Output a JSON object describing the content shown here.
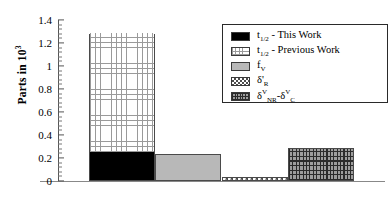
{
  "chart_data": {
    "type": "bar",
    "title": "",
    "xlabel": "",
    "ylabel": "Parts in 10",
    "ylabel_exponent": "3",
    "ylim": [
      0,
      1.4
    ],
    "ytick_step": 0.2,
    "yticks": [
      "1.4",
      "1.2",
      "1",
      "0.8",
      "0.6",
      "0.4",
      "0.2",
      "0"
    ],
    "ytick_values": [
      1.4,
      1.2,
      1.0,
      0.8,
      0.6,
      0.4,
      0.2,
      0.0
    ],
    "grid": false,
    "legend_position": "upper-right",
    "categories": [
      "bar-1",
      "bar-2",
      "bar-3",
      "bar-4"
    ],
    "series": [
      {
        "name": "t-half-this-work",
        "pattern": "solid-black",
        "values": [
          0.245,
          0,
          0,
          0
        ]
      },
      {
        "name": "t-half-previous-work",
        "pattern": "grid",
        "values": [
          1.03,
          0,
          0,
          0
        ],
        "stacked_on": "t-half-this-work",
        "stack_top": 1.275
      },
      {
        "name": "f-v",
        "pattern": "gray",
        "values": [
          0,
          0.232,
          0,
          0
        ]
      },
      {
        "name": "delta-prime-R",
        "pattern": "checker",
        "values": [
          0,
          0,
          0.035,
          0
        ]
      },
      {
        "name": "delta-V-NR-minus-delta-V-C",
        "pattern": "brick",
        "values": [
          0,
          0,
          0,
          0.29
        ]
      }
    ]
  },
  "legend": {
    "items": [
      {
        "name": "legend-t-half-this-work",
        "pattern": "solid-black",
        "prefix": "t",
        "sub": "1/2",
        "suffix": " - This Work"
      },
      {
        "name": "legend-t-half-previous-work",
        "pattern": "grid",
        "prefix": "t",
        "sub": "1/2",
        "suffix": " - Previous Work"
      },
      {
        "name": "legend-f-v",
        "pattern": "gray",
        "prefix": "f",
        "sub": "V",
        "suffix": ""
      },
      {
        "name": "legend-delta-prime-R",
        "pattern": "checker",
        "prefix": "δ'",
        "sub": "R",
        "suffix": ""
      },
      {
        "name": "legend-delta-V-nr-c",
        "pattern": "brick",
        "prefix": "δ",
        "sup": "V",
        "sub": "NR",
        "mid": "-δ",
        "sup2": "V",
        "sub2": "C",
        "suffix": ""
      }
    ]
  },
  "colors": {
    "axis": "#555555",
    "baseline": "#888888",
    "bar_border": "#4a4a4a",
    "solid_black": "#000000",
    "gray_fill": "#b8b8b8",
    "grid_lines": "#9a9a9a",
    "checker_dark": "#4d4d4d",
    "brick_base": "#9d9d9d",
    "brick_dark": "#2b2b2b",
    "legend_border": "#2a2a2a",
    "background": "#ffffff"
  }
}
